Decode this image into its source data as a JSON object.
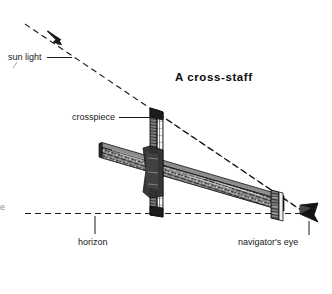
{
  "figure": {
    "title": "A cross-staff",
    "background_color": "#ffffff",
    "ink_color": "#1a1a1a",
    "width": 332,
    "height": 294,
    "labels": {
      "sun_light": "sun light",
      "crosspiece": "crosspiece",
      "horizon": "horizon",
      "navigators_eye": "navigator's eye",
      "edge_fragment": "e"
    },
    "icons": {
      "sun_ray_arrow": "arrow-down-right-icon",
      "eye": "eye-vane-icon"
    },
    "geometry": {
      "sun_ray": {
        "x1": 25,
        "y1": 24,
        "x2": 307,
        "y2": 214,
        "style": "dashed"
      },
      "horizon_line": {
        "x1": 25,
        "y1": 213,
        "x2": 305,
        "y2": 213,
        "style": "dashed"
      },
      "sight_line": {
        "x1": 158,
        "y1": 116,
        "x2": 305,
        "y2": 213,
        "style": "dashed"
      },
      "crosspiece_bar": {
        "x": 150,
        "y_top": 108,
        "y_bottom": 216,
        "width": 10
      },
      "staff_bar": {
        "x1": 102,
        "y1": 146,
        "x2": 280,
        "y2": 205,
        "thickness": 13
      },
      "sight_vane": {
        "x": 271,
        "y": 192,
        "width": 10,
        "height": 28
      },
      "eye_marker": {
        "x": 300,
        "y": 204,
        "width": 18,
        "height": 19
      }
    },
    "leaders": {
      "sun_light": {
        "x1": 46,
        "y1": 57,
        "x2": 70,
        "y2": 57
      },
      "crosspiece": {
        "x1": 117,
        "y1": 117,
        "x2": 150,
        "y2": 117
      },
      "horizon": {
        "x1": 95,
        "y1": 215,
        "x2": 95,
        "y2": 235
      },
      "navigators_eye": {
        "x1": 309,
        "y1": 222,
        "x2": 309,
        "y2": 236
      }
    }
  }
}
